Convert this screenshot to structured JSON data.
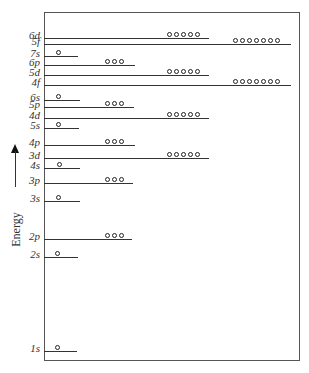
{
  "diagram": {
    "type": "orbital-energy-level-diagram",
    "axis_label": "Energy",
    "axis_arrow": "up",
    "frame": {
      "left": 44,
      "top": 12,
      "right": 300,
      "bottom": 361
    },
    "levels": [
      {
        "label": "6d",
        "y": 38,
        "x1": 44,
        "x2": 209,
        "orbitals": 5,
        "orb_x": 167
      },
      {
        "label": "5f",
        "y": 44,
        "x1": 44,
        "x2": 291,
        "orbitals": 7,
        "orb_x": 233
      },
      {
        "label": "7s",
        "y": 56,
        "x1": 44,
        "x2": 78,
        "orbitals": 1,
        "orb_x": 56
      },
      {
        "label": "6p",
        "y": 65,
        "x1": 44,
        "x2": 135,
        "orbitals": 3,
        "orb_x": 105
      },
      {
        "label": "5d",
        "y": 75,
        "x1": 44,
        "x2": 209,
        "orbitals": 5,
        "orb_x": 167
      },
      {
        "label": "4f",
        "y": 85,
        "x1": 44,
        "x2": 291,
        "orbitals": 7,
        "orb_x": 233
      },
      {
        "label": "6s",
        "y": 100,
        "x1": 44,
        "x2": 80,
        "orbitals": 1,
        "orb_x": 56
      },
      {
        "label": "5p",
        "y": 107,
        "x1": 44,
        "x2": 134,
        "orbitals": 3,
        "orb_x": 105
      },
      {
        "label": "4d",
        "y": 118,
        "x1": 44,
        "x2": 209,
        "orbitals": 5,
        "orb_x": 167
      },
      {
        "label": "5s",
        "y": 128,
        "x1": 44,
        "x2": 79,
        "orbitals": 1,
        "orb_x": 56
      },
      {
        "label": "4p",
        "y": 145,
        "x1": 44,
        "x2": 135,
        "orbitals": 3,
        "orb_x": 105
      },
      {
        "label": "3d",
        "y": 158,
        "x1": 44,
        "x2": 209,
        "orbitals": 5,
        "orb_x": 167
      },
      {
        "label": "4s",
        "y": 168,
        "x1": 44,
        "x2": 80,
        "orbitals": 1,
        "orb_x": 57
      },
      {
        "label": "3p",
        "y": 183,
        "x1": 44,
        "x2": 133,
        "orbitals": 3,
        "orb_x": 105
      },
      {
        "label": "3s",
        "y": 201,
        "x1": 44,
        "x2": 80,
        "orbitals": 1,
        "orb_x": 56
      },
      {
        "label": "2p",
        "y": 239,
        "x1": 44,
        "x2": 132,
        "orbitals": 3,
        "orb_x": 105
      },
      {
        "label": "2s",
        "y": 257,
        "x1": 44,
        "x2": 78,
        "orbitals": 1,
        "orb_x": 55
      },
      {
        "label": "1s",
        "y": 351,
        "x1": 44,
        "x2": 77,
        "orbitals": 1,
        "orb_x": 55
      }
    ]
  }
}
